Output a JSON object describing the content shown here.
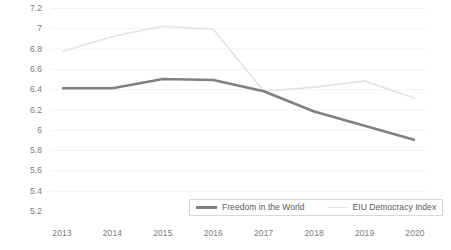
{
  "chart_data": {
    "type": "line",
    "title": "",
    "xlabel": "",
    "ylabel": "",
    "x": [
      2013,
      2014,
      2015,
      2016,
      2017,
      2018,
      2019,
      2020
    ],
    "xtick_labels": [
      "2013",
      "2014",
      "2015",
      "2016",
      "2017",
      "2018",
      "2019",
      "2020"
    ],
    "ytick_labels": [
      "7.2",
      "7",
      "6.8",
      "6.6",
      "6.4",
      "6.2",
      "6",
      "5.8",
      "5.6",
      "5.4",
      "5.2"
    ],
    "ytick_values": [
      7.2,
      7,
      6.8,
      6.6,
      6.4,
      6.2,
      6,
      5.8,
      5.6,
      5.4,
      5.2
    ],
    "ylim": [
      5.2,
      7.2
    ],
    "ystep": 0.2,
    "grid": true,
    "grid_axis": "y",
    "legend_position": "bottom-center",
    "series": [
      {
        "name": "Freedom in the World",
        "color": "#808080",
        "width": 2.6,
        "values": [
          6.41,
          6.41,
          6.5,
          6.49,
          6.38,
          6.18,
          6.04,
          5.9
        ]
      },
      {
        "name": "EIU Democracy Index",
        "color": "#e3e3e3",
        "width": 1.6,
        "values": [
          6.77,
          6.92,
          7.02,
          6.99,
          6.38,
          6.42,
          6.48,
          6.31
        ]
      }
    ]
  },
  "legend": {
    "items": [
      {
        "label": "Freedom in the World"
      },
      {
        "label": "EIU Democracy Index"
      }
    ]
  },
  "colors": {
    "series_1": "#808080",
    "series_2": "#e3e3e3",
    "axis_text": "#7b7b7b",
    "legend_text": "#595959",
    "legend_border": "#d9d9d9",
    "gridline": "#f2f2f2",
    "background": "#ffffff"
  }
}
